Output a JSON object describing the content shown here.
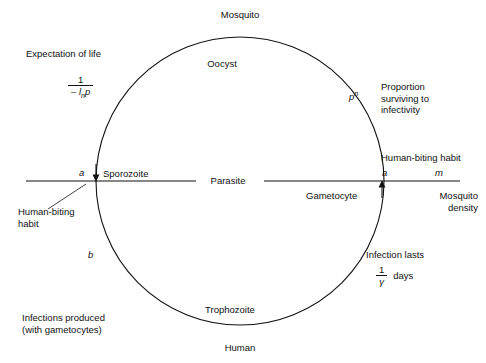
{
  "figure": {
    "type": "cycle-diagram",
    "circle": {
      "cx": 240,
      "cy": 181,
      "r": 144,
      "stroke": "#111111"
    },
    "background": "#ffffff"
  },
  "cycle_labels": {
    "top_outside": "Mosquito",
    "top_inside": "Oocyst",
    "bottom_inside": "Trophozoite",
    "bottom_outside": "Human",
    "center": "Parasite",
    "left_inside": "Sporozoite",
    "right_inside": "Gametocyte"
  },
  "left_annotations": {
    "expectation_title": "Expectation of life",
    "expectation_fraction": {
      "numerator": "1",
      "denominator_prefix": "– l",
      "denominator_sub": "n",
      "denominator_suffix": "p"
    },
    "biting_symbol": "a",
    "biting_habit_line1": "Human-biting",
    "biting_habit_line2": "habit",
    "arc_symbol": "b",
    "infections_line1": "Infections produced",
    "infections_line2": "(with gametocytes)"
  },
  "right_annotations": {
    "survival_symbol_base": "p",
    "survival_symbol_exponent": "n",
    "proportion_line1": "Proportion",
    "proportion_line2": "surviving to",
    "proportion_line3": "infectivity",
    "biting_habit": "Human-biting habit",
    "biting_symbol": "a",
    "density_symbol": "m",
    "density_line1": "Mosquito",
    "density_line2": "density",
    "infection_lasts": "Infection lasts",
    "duration_fraction": {
      "numerator": "1",
      "denominator": "γ"
    },
    "duration_unit": "days"
  },
  "arrows": {
    "left_arrow_direction": "down",
    "right_arrow_direction": "up"
  }
}
